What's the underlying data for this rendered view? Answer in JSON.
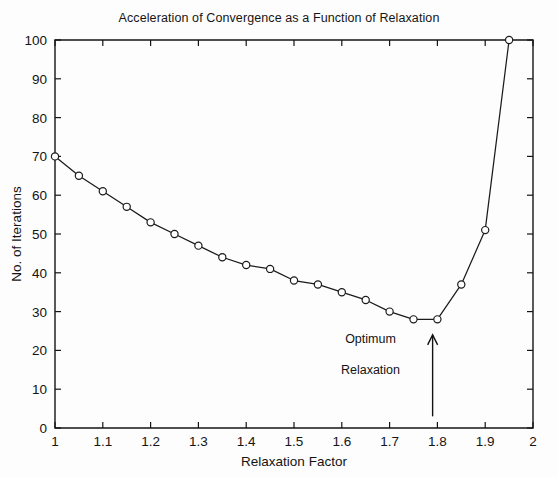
{
  "chart_data": {
    "type": "line",
    "title": "Acceleration of Convergence as a Function of Relaxation",
    "xlabel": "Relaxation Factor",
    "ylabel": "No. of Iterations",
    "xlim": [
      1,
      2
    ],
    "ylim": [
      0,
      100
    ],
    "xticks": [
      1,
      1.1,
      1.2,
      1.3,
      1.4,
      1.5,
      1.6,
      1.7,
      1.8,
      1.9,
      2
    ],
    "xtick_labels": [
      "1",
      "1.1",
      "1.2",
      "1.3",
      "1.4",
      "1.5",
      "1.6",
      "1.7",
      "1.8",
      "1.9",
      "2"
    ],
    "yticks": [
      0,
      10,
      20,
      30,
      40,
      50,
      60,
      70,
      80,
      90,
      100
    ],
    "ytick_labels": [
      "0",
      "10",
      "20",
      "30",
      "40",
      "50",
      "60",
      "70",
      "80",
      "90",
      "100"
    ],
    "grid": false,
    "legend": false,
    "marker": "circle",
    "line_color": "#1b1b1b",
    "marker_face_color": "#ffffff",
    "x": [
      1.0,
      1.05,
      1.1,
      1.15,
      1.2,
      1.25,
      1.3,
      1.35,
      1.4,
      1.45,
      1.5,
      1.55,
      1.6,
      1.65,
      1.7,
      1.75,
      1.8,
      1.85,
      1.9,
      1.95
    ],
    "y": [
      70,
      65,
      61,
      57,
      53,
      50,
      47,
      44,
      42,
      41,
      38,
      37,
      35,
      33,
      30,
      28,
      28,
      37,
      51,
      100
    ],
    "annotations": [
      {
        "name": "optimum-relaxation-label",
        "line1": "Optimum",
        "line2": "Relaxation",
        "x": 1.66,
        "y_line1": 22,
        "y_line2": 14,
        "arrow_x": 1.79,
        "arrow_y_start": 3,
        "arrow_y_end": 24
      }
    ]
  }
}
